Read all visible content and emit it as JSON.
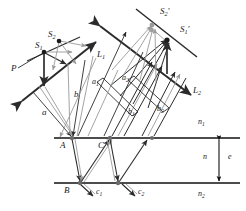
{
  "figure": {
    "width": 246,
    "height": 211,
    "background": "#ffffff",
    "colors": {
      "ink": "#1a1a1a",
      "dark_ray": "#2b2b2b",
      "light_ray": "#9a9a9a",
      "interface_line": "#111111"
    },
    "labels": [
      {
        "id": "P",
        "text": "P",
        "sub": "",
        "prime": false,
        "x": 11,
        "y": 64
      },
      {
        "id": "S1",
        "text": "S",
        "sub": "1",
        "prime": false,
        "x": 35,
        "y": 41
      },
      {
        "id": "S2",
        "text": "S",
        "sub": "2",
        "prime": false,
        "x": 48,
        "y": 30
      },
      {
        "id": "S2prime",
        "text": "S",
        "sub": "2",
        "prime": true,
        "x": 160,
        "y": 7
      },
      {
        "id": "S1prime",
        "text": "S",
        "sub": "1",
        "prime": true,
        "x": 180,
        "y": 25
      },
      {
        "id": "L1",
        "text": "L",
        "sub": "1",
        "prime": false,
        "x": 97,
        "y": 50
      },
      {
        "id": "L2",
        "text": "L",
        "sub": "2",
        "prime": false,
        "x": 193,
        "y": 86
      },
      {
        "id": "a",
        "text": "a",
        "sub": "",
        "prime": false,
        "x": 42,
        "y": 108
      },
      {
        "id": "b",
        "text": "b",
        "sub": "",
        "prime": false,
        "x": 74,
        "y": 90
      },
      {
        "id": "a2",
        "text": "a",
        "sub": "2",
        "prime": false,
        "x": 122,
        "y": 74
      },
      {
        "id": "a1",
        "text": "a",
        "sub": "1",
        "prime": false,
        "x": 92,
        "y": 78
      },
      {
        "id": "b1",
        "text": "b",
        "sub": "1",
        "prime": false,
        "x": 128,
        "y": 108
      },
      {
        "id": "b2",
        "text": "b",
        "sub": "2",
        "prime": false,
        "x": 157,
        "y": 105
      },
      {
        "id": "A",
        "text": "A",
        "sub": "",
        "prime": false,
        "x": 60,
        "y": 141
      },
      {
        "id": "C",
        "text": "C",
        "sub": "",
        "prime": false,
        "x": 98,
        "y": 141
      },
      {
        "id": "B",
        "text": "B",
        "sub": "",
        "prime": false,
        "x": 64,
        "y": 186
      },
      {
        "id": "c1",
        "text": "c",
        "sub": "1",
        "prime": false,
        "x": 96,
        "y": 188
      },
      {
        "id": "c2",
        "text": "c",
        "sub": "2",
        "prime": false,
        "x": 138,
        "y": 188
      },
      {
        "id": "n1_top",
        "text": "n",
        "sub": "1",
        "prime": false,
        "x": 198,
        "y": 118
      },
      {
        "id": "n_mid",
        "text": "n",
        "sub": "",
        "prime": false,
        "x": 203,
        "y": 153
      },
      {
        "id": "e_thick",
        "text": "e",
        "sub": "",
        "prime": false,
        "x": 224,
        "y": 153
      },
      {
        "id": "n2_bot",
        "text": "n",
        "sub": "2",
        "prime": false,
        "x": 198,
        "y": 190
      }
    ],
    "interfaces": [
      {
        "id": "top-interface",
        "y": 138,
        "x1": 54,
        "x2": 240
      },
      {
        "id": "bottom-interface",
        "y": 183,
        "x1": 54,
        "x2": 240
      }
    ],
    "thickness_marker": {
      "id": "film-thickness-arrow",
      "x": 219,
      "y1": 138,
      "y2": 183
    },
    "points": [
      {
        "id": "point-S1",
        "x": 44,
        "y": 52
      },
      {
        "id": "point-S2",
        "x": 59,
        "y": 41
      },
      {
        "id": "point-A",
        "x": 72,
        "y": 138
      },
      {
        "id": "point-C",
        "x": 110,
        "y": 138
      },
      {
        "id": "point-B",
        "x": 80,
        "y": 183
      },
      {
        "id": "point-D",
        "x": 118,
        "y": 183
      },
      {
        "id": "point-S1p",
        "x": 167,
        "y": 40
      },
      {
        "id": "point-S2p",
        "x": 152,
        "y": 25
      }
    ],
    "lens_lines": [
      {
        "id": "lens-L1-axis",
        "x1": 27,
        "y1": 96,
        "x2": 93,
        "y2": 44
      },
      {
        "id": "lens-L2-axis",
        "x1": 103,
        "y1": 27,
        "x2": 190,
        "y2": 94
      },
      {
        "id": "mirror-plane-upper",
        "x1": 137,
        "y1": 10,
        "x2": 196,
        "y2": 56
      },
      {
        "id": "source-plane",
        "x1": 28,
        "y1": 60,
        "x2": 79,
        "y2": 38
      }
    ]
  }
}
